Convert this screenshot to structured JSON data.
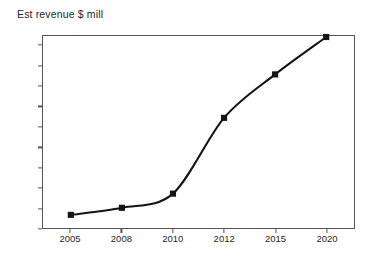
{
  "chart_data": {
    "type": "line",
    "title": "Est revenue $ mill",
    "xlabel": "",
    "ylabel": "",
    "categories": [
      "2005",
      "2008",
      "2010",
      "2012",
      "2015",
      "2020"
    ],
    "values": [
      65,
      100,
      170,
      545,
      760,
      945
    ],
    "series": [
      {
        "name": "Est revenue $ mill",
        "values": [
          65,
          100,
          170,
          545,
          760,
          945
        ]
      }
    ],
    "ylim": [
      0,
      950
    ],
    "ytick_labels": [
      "0",
      "100",
      "200",
      "300",
      "400",
      "500",
      "600",
      "700",
      "800",
      "900"
    ],
    "ytick_values": [
      0,
      100,
      200,
      300,
      400,
      500,
      600,
      700,
      800,
      900
    ],
    "grid": false,
    "legend": false,
    "legend_position": "none",
    "marker": "square",
    "line_color": "#141414",
    "marker_color": "#141414",
    "axis_color": "#555555",
    "background_color": "#ffffff",
    "text_color": "#262626"
  },
  "figure": {
    "title_label": "Est revenue $ mill"
  }
}
